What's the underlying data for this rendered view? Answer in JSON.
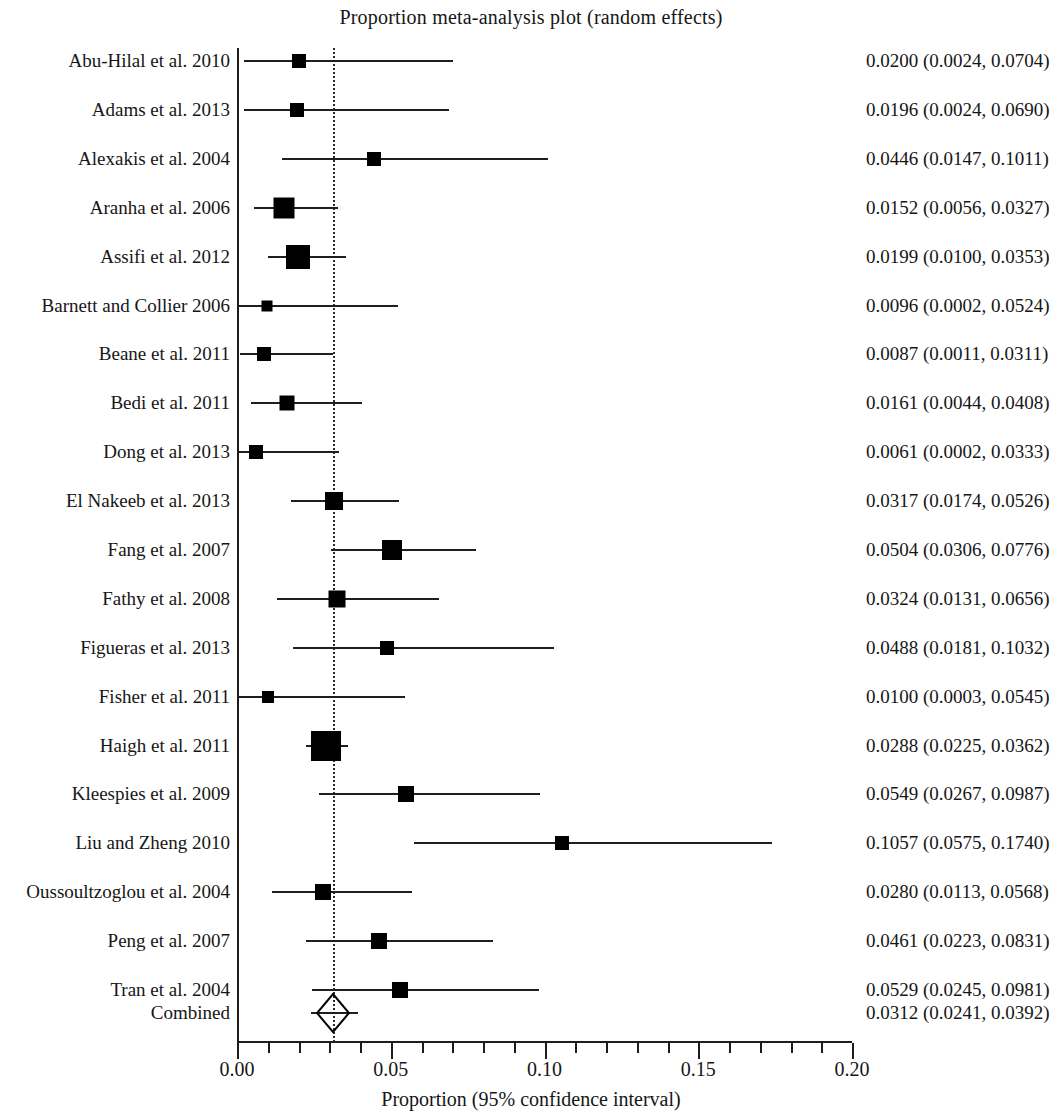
{
  "chart_data": {
    "type": "forest",
    "title": "Proportion meta-analysis plot (random effects)",
    "xlabel": "Proportion (95% confidence interval)",
    "ylabel": "",
    "xlim": [
      0.0,
      0.2
    ],
    "xticks": [
      "0.00",
      "0.05",
      "0.10",
      "0.15",
      "0.20"
    ],
    "xtick_values": [
      0.0,
      0.05,
      0.1,
      0.15,
      0.2
    ],
    "minor_tick_step": 0.01,
    "grid": false,
    "reference_line": 0.0312,
    "model": "random effects",
    "categories": [
      "Abu-Hilal et al. 2010",
      "Adams et al. 2013",
      "Alexakis et al. 2004",
      "Aranha et al. 2006",
      "Assifi et al. 2012",
      "Barnett and Collier 2006",
      "Beane et al. 2011",
      "Bedi et al. 2011",
      "Dong et al. 2013",
      "El Nakeeb et al. 2013",
      "Fang et al. 2007",
      "Fathy et al. 2008",
      "Figueras et al. 2013",
      "Fisher et al. 2011",
      "Haigh et al. 2011",
      "Kleespies et al. 2009",
      "Liu and Zheng 2010",
      "Oussoultzoglou et al. 2004",
      "Peng et al. 2007",
      "Tran et al. 2004",
      "Combined"
    ],
    "rows": [
      {
        "label": "Abu-Hilal et al. 2010",
        "estimate": 0.02,
        "lower": 0.0024,
        "upper": 0.0704,
        "text": "0.0200 (0.0024, 0.0704)",
        "marker": "square",
        "size": 14,
        "y": 61
      },
      {
        "label": "Adams et al. 2013",
        "estimate": 0.0196,
        "lower": 0.0024,
        "upper": 0.069,
        "text": "0.0196 (0.0024, 0.0690)",
        "marker": "square",
        "size": 14,
        "y": 110
      },
      {
        "label": "Alexakis et al. 2004",
        "estimate": 0.0446,
        "lower": 0.0147,
        "upper": 0.1011,
        "text": "0.0446 (0.0147, 0.1011)",
        "marker": "square",
        "size": 14,
        "y": 159
      },
      {
        "label": "Aranha et al. 2006",
        "estimate": 0.0152,
        "lower": 0.0056,
        "upper": 0.0327,
        "text": "0.0152 (0.0056, 0.0327)",
        "marker": "square",
        "size": 21,
        "y": 208
      },
      {
        "label": "Assifi et al. 2012",
        "estimate": 0.0199,
        "lower": 0.01,
        "upper": 0.0353,
        "text": "0.0199 (0.0100, 0.0353)",
        "marker": "square",
        "size": 24,
        "y": 257
      },
      {
        "label": "Barnett and Collier 2006",
        "estimate": 0.0096,
        "lower": 0.0002,
        "upper": 0.0524,
        "text": "0.0096 (0.0002, 0.0524)",
        "marker": "square",
        "size": 11,
        "y": 306
      },
      {
        "label": "Beane et al. 2011",
        "estimate": 0.0087,
        "lower": 0.0011,
        "upper": 0.0311,
        "text": "0.0087 (0.0011, 0.0311)",
        "marker": "square",
        "size": 14,
        "y": 354
      },
      {
        "label": "Bedi et al. 2011",
        "estimate": 0.0161,
        "lower": 0.0044,
        "upper": 0.0408,
        "text": "0.0161 (0.0044, 0.0408)",
        "marker": "square",
        "size": 15,
        "y": 403
      },
      {
        "label": "Dong et al. 2013",
        "estimate": 0.0061,
        "lower": 0.0002,
        "upper": 0.0333,
        "text": "0.0061 (0.0002, 0.0333)",
        "marker": "square",
        "size": 14,
        "y": 452
      },
      {
        "label": "El Nakeeb et al. 2013",
        "estimate": 0.0317,
        "lower": 0.0174,
        "upper": 0.0526,
        "text": "0.0317 (0.0174, 0.0526)",
        "marker": "square",
        "size": 18,
        "y": 501
      },
      {
        "label": "Fang et al. 2007",
        "estimate": 0.0504,
        "lower": 0.0306,
        "upper": 0.0776,
        "text": "0.0504 (0.0306, 0.0776)",
        "marker": "square",
        "size": 20,
        "y": 550
      },
      {
        "label": "Fathy et al. 2008",
        "estimate": 0.0324,
        "lower": 0.0131,
        "upper": 0.0656,
        "text": "0.0324 (0.0131, 0.0656)",
        "marker": "square",
        "size": 17,
        "y": 599
      },
      {
        "label": "Figueras et al. 2013",
        "estimate": 0.0488,
        "lower": 0.0181,
        "upper": 0.1032,
        "text": "0.0488 (0.0181, 0.1032)",
        "marker": "square",
        "size": 14,
        "y": 648
      },
      {
        "label": "Fisher et al. 2011",
        "estimate": 0.01,
        "lower": 0.0003,
        "upper": 0.0545,
        "text": "0.0100 (0.0003, 0.0545)",
        "marker": "square",
        "size": 12,
        "y": 697
      },
      {
        "label": "Haigh et al. 2011",
        "estimate": 0.0288,
        "lower": 0.0225,
        "upper": 0.0362,
        "text": "0.0288 (0.0225, 0.0362)",
        "marker": "square",
        "size": 30,
        "y": 746
      },
      {
        "label": "Kleespies et al. 2009",
        "estimate": 0.0549,
        "lower": 0.0267,
        "upper": 0.0987,
        "text": "0.0549 (0.0267, 0.0987)",
        "marker": "square",
        "size": 16,
        "y": 794
      },
      {
        "label": "Liu and Zheng 2010",
        "estimate": 0.1057,
        "lower": 0.0575,
        "upper": 0.174,
        "text": "0.1057 (0.0575, 0.1740)",
        "marker": "square",
        "size": 14,
        "y": 843
      },
      {
        "label": "Oussoultzoglou et al. 2004",
        "estimate": 0.028,
        "lower": 0.0113,
        "upper": 0.0568,
        "text": "0.0280 (0.0113, 0.0568)",
        "marker": "square",
        "size": 16,
        "y": 892
      },
      {
        "label": "Peng et al. 2007",
        "estimate": 0.0461,
        "lower": 0.0223,
        "upper": 0.0831,
        "text": "0.0461 (0.0223, 0.0831)",
        "marker": "square",
        "size": 16,
        "y": 941
      },
      {
        "label": "Tran et al. 2004",
        "estimate": 0.0529,
        "lower": 0.0245,
        "upper": 0.0981,
        "text": "0.0529 (0.0245, 0.0981)",
        "marker": "square",
        "size": 16,
        "y": 990
      },
      {
        "label": "Combined",
        "estimate": 0.0312,
        "lower": 0.0241,
        "upper": 0.0392,
        "text": "0.0312 (0.0241, 0.0392)",
        "marker": "diamond",
        "size": 0,
        "y": 1013
      }
    ],
    "colors": {
      "marker": "#000000",
      "line": "#1f1f1f",
      "axis": "#1d1d1d",
      "text": "#161616",
      "background": "#ffffff"
    }
  }
}
